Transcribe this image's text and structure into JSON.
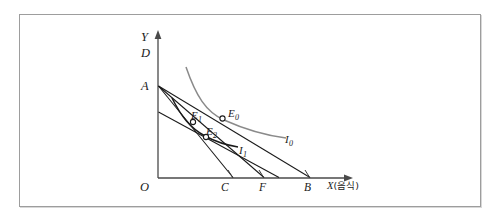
{
  "figure": {
    "type": "indifference-curve-budget-line-diagram",
    "axes": {
      "y_label": "Y",
      "x_label_symbol": "X",
      "x_label_note": "(음식)",
      "origin_label": "O"
    },
    "axis_points": [
      {
        "id": "D",
        "label": "D",
        "axis": "y"
      },
      {
        "id": "A",
        "label": "A",
        "axis": "y"
      },
      {
        "id": "C",
        "label": "C",
        "axis": "x"
      },
      {
        "id": "F",
        "label": "F",
        "axis": "x"
      },
      {
        "id": "B",
        "label": "B",
        "axis": "x"
      }
    ],
    "equilibria": [
      {
        "id": "E0",
        "label": "E",
        "subscript": "0"
      },
      {
        "id": "E1",
        "label": "E",
        "subscript": "1"
      },
      {
        "id": "E2",
        "label": "E",
        "subscript": "2"
      }
    ],
    "curves": [
      {
        "id": "I0",
        "label": "I",
        "subscript": "0",
        "color": "#8a8a8a"
      },
      {
        "id": "I1",
        "label": "I",
        "subscript": "1",
        "color": "#1a1a1a"
      }
    ],
    "colors": {
      "frame": "#9d9d9d",
      "axis": "#4a4a4a",
      "budget_line": "#1a1a1a",
      "curve_i0": "#8a8a8a",
      "curve_i1": "#1a1a1a",
      "background": "#ffffff"
    }
  }
}
